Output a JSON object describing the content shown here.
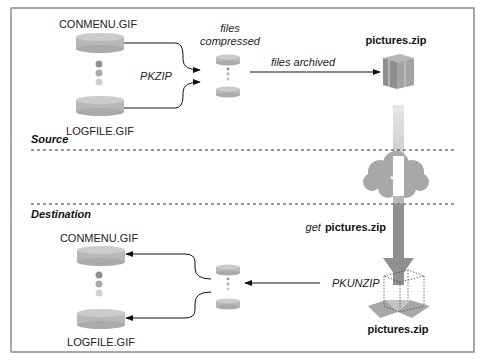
{
  "diagram": {
    "sections": {
      "source": "Source",
      "destination": "Destination"
    },
    "source": {
      "file_top": "CONMENU.GIF",
      "file_bottom": "LOGFILE.GIF",
      "compress_tool": "PKZIP",
      "compressed_label_line1": "files",
      "compressed_label_line2": "compressed",
      "archive_arrow_label": "files archived",
      "archive_name": "pictures.zip"
    },
    "transfer": {
      "get_prefix": "get",
      "get_file": "pictures.zip"
    },
    "destination": {
      "archive_name": "pictures.zip",
      "extract_tool": "PKUNZIP",
      "file_top": "CONMENU.GIF",
      "file_bottom": "LOGFILE.GIF"
    },
    "colors": {
      "disk": "#b5b5b5",
      "disk_top": "#c8c8c8",
      "box": "#9a9a9a",
      "cloud": "#a8a8a8",
      "arrow_gray": "#8c8c8c",
      "border": "#888888"
    }
  }
}
